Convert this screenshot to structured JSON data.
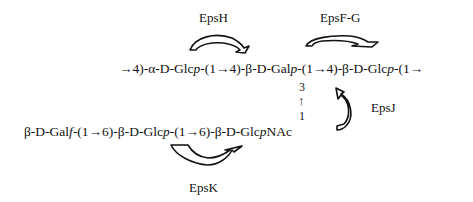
{
  "diagram": {
    "enzymes": [
      {
        "id": "epsH",
        "label": "EpsH"
      },
      {
        "id": "epsFG",
        "label": "EpsF-G"
      },
      {
        "id": "epsJ",
        "label": "EpsJ"
      },
      {
        "id": "epsK",
        "label": "EpsK"
      }
    ],
    "main_chain": {
      "seg1": "→4)-α-D-Glc",
      "seg1_it": "p",
      "seg2": "-(1→4)-β-D-Gal",
      "seg2_it": "p",
      "seg3": "-(1→4)-β-D-Glc",
      "seg3_it": "p",
      "seg4": "-(1→"
    },
    "branch_link": {
      "top": "3",
      "arrow": "↑",
      "bottom": "1"
    },
    "side_chain": {
      "seg1": "β-D-Gal",
      "seg1_it": "f",
      "seg2": "-(1→6)-β-D-Glc",
      "seg2_it": "p",
      "seg3": "-(1→6)-β-D-Glc",
      "seg3_it": "p",
      "seg4": "NAc"
    }
  }
}
